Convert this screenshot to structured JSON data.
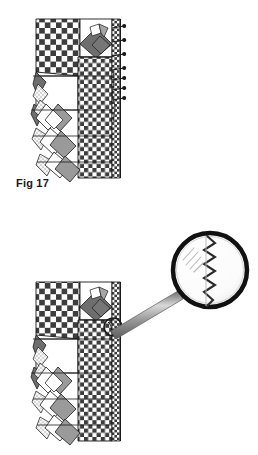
{
  "document": {
    "type": "sewing-instruction-diagram",
    "background_color": "#ffffff"
  },
  "figures": [
    {
      "id": "fig-17",
      "label": "Fig 17",
      "caption_position": "bottom-left",
      "description": "Patchwork garment panel with checkerboard yoke, plain white block, diamond patches and pin markers along right edge"
    },
    {
      "id": "fig-18",
      "label": "Fig 18",
      "caption_position": "bottom-left",
      "description": "Same patchwork garment panel with magnifying glass showing zigzag stitch detail at the seam"
    }
  ],
  "palette": {
    "outline": "#1a1a1a",
    "checker_dark": "#3d3d3d",
    "checker_light": "#ffffff",
    "diamond_dark_gray": "#6e6e6e",
    "diamond_mid_gray": "#9a9a9a",
    "diamond_light_gray": "#c7c7c7",
    "speckle_gray": "#b5b5b5",
    "handle_gray": "#8c8c8c",
    "lens_rim": "#111111",
    "lens_fill": "#ffffff",
    "stitch_color": "#2b2b2b"
  },
  "annotations": {
    "magnifier": {
      "name": "magnifying-glass",
      "shows": "zigzag-stitch-detail",
      "target_mark": "circle-marker-on-seam"
    },
    "pins": {
      "name": "pin-markers",
      "count": 7,
      "edge": "right"
    }
  }
}
